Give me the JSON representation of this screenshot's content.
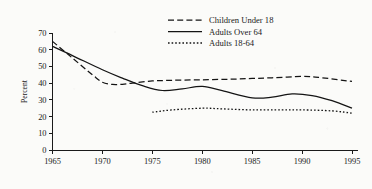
{
  "chart_data": {
    "type": "line",
    "title": "",
    "subtitle": "",
    "xlabel": "",
    "ylabel": "Percent",
    "xlim": [
      1965,
      1995
    ],
    "ylim": [
      0,
      70
    ],
    "grid": false,
    "legend_position": "top-center",
    "x_ticks": [
      "1965",
      "1970",
      "1975",
      "1980",
      "1985",
      "1990",
      "1995"
    ],
    "y_ticks": [
      "0",
      "10",
      "20",
      "30",
      "40",
      "50",
      "60",
      "70"
    ],
    "series": [
      {
        "name": "Children Under 18",
        "style": "dashed",
        "color": "#141414",
        "x": [
          1965,
          1967,
          1969,
          1970,
          1971,
          1972,
          1973,
          1975,
          1977,
          1980,
          1983,
          1985,
          1987,
          1990,
          1992,
          1995
        ],
        "values": [
          65.0,
          55.0,
          45.0,
          40.5,
          39.2,
          39.3,
          40.0,
          41.3,
          41.7,
          42.0,
          42.4,
          42.8,
          43.2,
          44.0,
          43.2,
          41.0
        ]
      },
      {
        "name": "Adults Over 64",
        "style": "solid",
        "color": "#141414",
        "x": [
          1965,
          1967,
          1970,
          1972,
          1974,
          1976,
          1978,
          1980,
          1982,
          1985,
          1987,
          1989,
          1991,
          1993,
          1995
        ],
        "values": [
          62.0,
          56.5,
          48.0,
          43.0,
          38.5,
          35.6,
          36.6,
          38.0,
          35.5,
          31.2,
          31.6,
          33.6,
          32.6,
          29.5,
          25.0
        ]
      },
      {
        "name": "Adults 18-64",
        "style": "dotted",
        "color": "#141414",
        "x": [
          1975,
          1977,
          1980,
          1982,
          1985,
          1988,
          1990,
          1993,
          1995
        ],
        "values": [
          22.6,
          24.0,
          25.0,
          24.6,
          24.0,
          24.0,
          24.0,
          23.4,
          22.0
        ]
      }
    ]
  },
  "legend": {
    "items": [
      {
        "label": "Children Under 18",
        "style": "dashed"
      },
      {
        "label": "Adults Over 64",
        "style": "solid"
      },
      {
        "label": "Adults 18-64",
        "style": "dotted"
      }
    ]
  }
}
